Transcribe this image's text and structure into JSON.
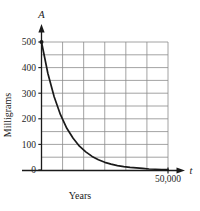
{
  "chart_data": {
    "type": "line",
    "title": "",
    "subtitle": "",
    "xlabel": "Years",
    "ylabel": "Milligrams",
    "x_axis_symbol": "t",
    "y_axis_symbol": "A",
    "xlim": [
      0,
      50000
    ],
    "ylim": [
      0,
      500
    ],
    "x_ticks": [
      0,
      50000
    ],
    "x_tick_labels": [
      "0",
      "50,000"
    ],
    "y_ticks": [
      0,
      100,
      200,
      300,
      400,
      500
    ],
    "y_tick_labels": [
      "0",
      "100",
      "200",
      "300",
      "400",
      "500"
    ],
    "grid": true,
    "grid_x_count": 6,
    "grid_y_step": 50,
    "legend": null,
    "annotations": [],
    "series": [
      {
        "name": "Remaining amount",
        "description": "exponential decay from 500 mg toward 0",
        "initial_value": 500,
        "x": [
          0,
          2500,
          5000,
          7500,
          10000,
          12500,
          15000,
          17500,
          20000,
          22500,
          25000,
          27500,
          30000,
          32500,
          35000,
          37500,
          40000,
          42500,
          45000,
          47500,
          50000
        ],
        "y": [
          500,
          378,
          286,
          216,
          163,
          124,
          93,
          71,
          53,
          40,
          30,
          23,
          17,
          13,
          10,
          8,
          6,
          4,
          3,
          2,
          2
        ]
      }
    ]
  },
  "axes": {
    "y_symbol": "A",
    "x_symbol": "t",
    "y_name": "Milligrams",
    "x_name": "Years",
    "x_end_tick_label": "50,000",
    "origin_label": "0"
  },
  "colors": {
    "curve": "#1a1a1a",
    "axis": "#1a1a1a",
    "grid": "#8c8c8c",
    "background": "#ffffff",
    "text": "#1a1a1a"
  }
}
